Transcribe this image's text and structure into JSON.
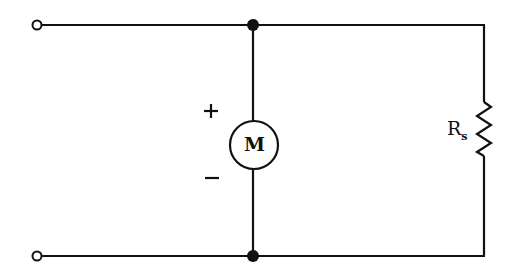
{
  "diagram": {
    "type": "circuit-schematic",
    "components": {
      "motor": {
        "symbol": "M",
        "plus": "+",
        "minus": "−"
      },
      "resistor": {
        "label": "R",
        "subscript": "s"
      }
    },
    "terminals": [
      "input-terminal-top",
      "input-terminal-bottom"
    ],
    "junctions": [
      "junction-top",
      "junction-bottom"
    ],
    "colors": {
      "line": "#111111",
      "background": "#ffffff"
    }
  }
}
